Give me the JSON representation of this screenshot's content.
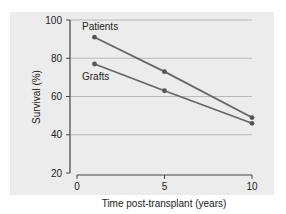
{
  "chart_data": {
    "type": "line",
    "title": "",
    "xlabel": "Time post-transplant (years)",
    "ylabel": "Survival (%)",
    "xlim": [
      0,
      10
    ],
    "ylim": [
      20,
      100
    ],
    "x_ticks": [
      "0",
      "5",
      "10"
    ],
    "y_ticks": [
      "20",
      "40",
      "60",
      "80",
      "100"
    ],
    "grid": "horizontal",
    "legend": "inline labels",
    "x": [
      1,
      5,
      10
    ],
    "series": [
      {
        "name": "Patients",
        "values": [
          91,
          73,
          49
        ]
      },
      {
        "name": "Grafts",
        "values": [
          77,
          63,
          46
        ]
      }
    ]
  },
  "colors": {
    "panel": "#ececec",
    "line": "#666666",
    "marker": "#555555",
    "grid": "#b8b8b8",
    "axis": "#444444"
  }
}
